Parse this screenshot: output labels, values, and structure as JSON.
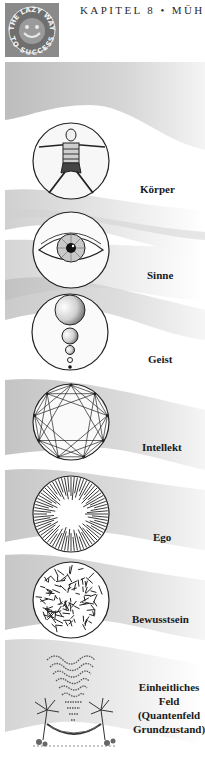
{
  "header": {
    "chapter_title": "KAPITEL 8 • MÜHE",
    "logo_text_top": "THE LAZY WAY",
    "logo_text_bottom": "TO SUCCESS"
  },
  "diagram": {
    "levels": [
      {
        "id": "koerper",
        "label": "Körper",
        "icon": "vitruvian-man-icon"
      },
      {
        "id": "sinne",
        "label": "Sinne",
        "icon": "eye-icon"
      },
      {
        "id": "geist",
        "label": "Geist",
        "icon": "descending-spheres-icon"
      },
      {
        "id": "intellekt",
        "label": "Intellekt",
        "icon": "nine-point-star-icon"
      },
      {
        "id": "ego",
        "label": "Ego",
        "icon": "radiating-lines-icon"
      },
      {
        "id": "bewusstsein",
        "label": "Bewusstsein",
        "icon": "scattered-dashes-icon"
      },
      {
        "id": "feld",
        "label_lines": [
          "Einheitliches",
          "Feld",
          "(Quantenfeld",
          "Grundzustand)"
        ],
        "icon": "hammock-palms-waves-icon"
      }
    ]
  },
  "colors": {
    "band_gray": "#c8c8c8",
    "logo_bg": "#8d8d8d",
    "ink": "#1a1a1a"
  }
}
